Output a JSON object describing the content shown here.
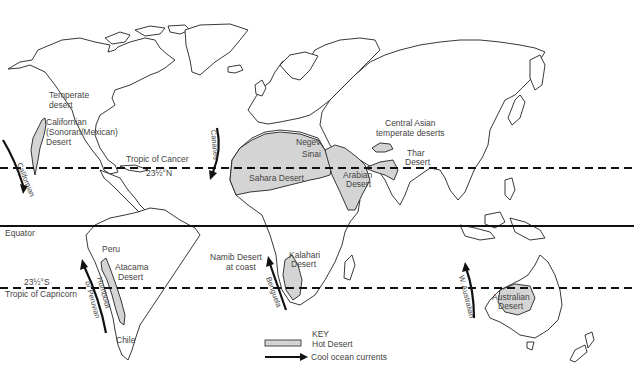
{
  "map": {
    "title": "World hot deserts and cool ocean currents",
    "lines": {
      "tropic_cancer": {
        "label": "Tropic of Cancer",
        "degrees": "23½°N"
      },
      "equator": {
        "label": "Equator"
      },
      "tropic_capricorn": {
        "label": "Tropic of Capricorn",
        "degrees": "23½°S"
      }
    },
    "deserts": [
      {
        "id": "temperate-na",
        "lines": [
          "Temperate",
          "desert"
        ]
      },
      {
        "id": "californian",
        "lines": [
          "Californian",
          "(Sonoran/Mexican)",
          "Desert"
        ]
      },
      {
        "id": "sahara",
        "lines": [
          "Sahara Desert"
        ]
      },
      {
        "id": "negev",
        "lines": [
          "Negev"
        ]
      },
      {
        "id": "sinai",
        "lines": [
          "Sinai"
        ]
      },
      {
        "id": "arabian",
        "lines": [
          "Arabian",
          "Desert"
        ]
      },
      {
        "id": "central-asian",
        "lines": [
          "Central Asian",
          "temperate deserts"
        ]
      },
      {
        "id": "thar",
        "lines": [
          "Thar",
          "Desert"
        ]
      },
      {
        "id": "peru",
        "lines": [
          "Peru"
        ]
      },
      {
        "id": "atacama",
        "lines": [
          "Atacama",
          "Desert"
        ]
      },
      {
        "id": "chile",
        "lines": [
          "Chile"
        ]
      },
      {
        "id": "namib",
        "lines": [
          "Namib Desert",
          "at coast"
        ]
      },
      {
        "id": "kalahari",
        "lines": [
          "Kalahari",
          "Desert"
        ]
      },
      {
        "id": "australian",
        "lines": [
          "Australian",
          "Desert"
        ]
      }
    ],
    "currents": [
      {
        "id": "californian",
        "label": "Californian"
      },
      {
        "id": "canaries",
        "label": "Canaries"
      },
      {
        "id": "humboldt",
        "label": "Humboldt",
        "label2": "or Peruvian"
      },
      {
        "id": "benguela",
        "label": "Benguela"
      },
      {
        "id": "w-australian",
        "label": "W. Australian"
      }
    ],
    "key": {
      "title": "KEY",
      "hot_desert": "Hot Desert",
      "cool_currents": "Cool ocean currents"
    },
    "colors": {
      "desert_fill": "#d4d4d4",
      "outline": "#222222",
      "text": "#444444"
    }
  }
}
